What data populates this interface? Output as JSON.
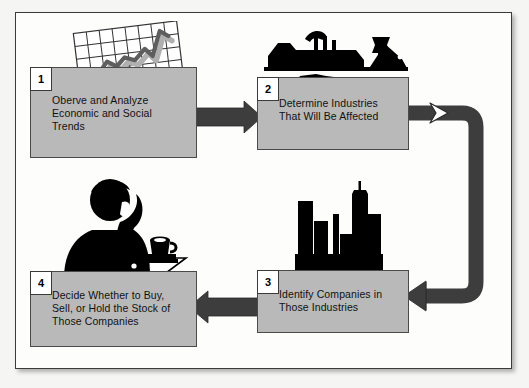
{
  "diagram": {
    "background_color": "#f5f5f3",
    "frame_color": "#fdfdfc",
    "box_fill_color": "#b9b9b9",
    "box_border_color": "#4a4a4a",
    "arrow_color": "#3d3d3d",
    "art_color": "#000000",
    "steps": [
      {
        "number": "1",
        "label": "Oberve and Analyze\nEconomic and Social\nTrends",
        "icon": "line-chart-graphic"
      },
      {
        "number": "2",
        "label": "Determine Industries\nThat Will Be Affected",
        "icon": "factory-industry-graphic"
      },
      {
        "number": "3",
        "label": "Identify Companies in\nThose Industries",
        "icon": "city-skyline-graphic"
      },
      {
        "number": "4",
        "label": "Decide Whether to Buy,\nSell, or Hold the Stock of\nThose Companies",
        "icon": "person-at-desk-graphic"
      }
    ],
    "connectors": [
      {
        "from": "1",
        "to": "2",
        "direction": "right",
        "icon": "arrow-right-icon"
      },
      {
        "from": "2",
        "to": "3",
        "direction": "right-down-left",
        "icon": "elbow-arrow-icon"
      },
      {
        "from": "3",
        "to": "4",
        "direction": "left",
        "icon": "arrow-left-icon"
      }
    ]
  }
}
